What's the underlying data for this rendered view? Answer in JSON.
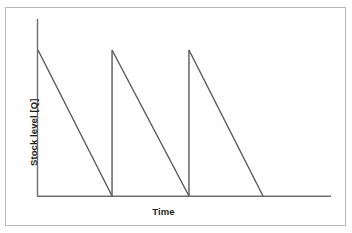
{
  "figure": {
    "background_color": "#ffffff",
    "border_color": "#b9b9b9",
    "line_color": "#58595b",
    "axis_color": "#6d6e71"
  },
  "axes": {
    "y_title": "Stock level [Q]",
    "x_title": "Time"
  },
  "chart_data": {
    "type": "line",
    "title": "",
    "subtitle": "",
    "xlabel": "Time",
    "ylabel": "Stock level [Q]",
    "xlim": [
      0,
      10
    ],
    "ylim": [
      0,
      1.18
    ],
    "grid": false,
    "legend": "none",
    "annotations": [],
    "x_tick_labels": [],
    "y_tick_labels": [],
    "series": [
      {
        "name": "Stock level",
        "x": [
          0.0,
          2.6,
          2.6,
          5.3,
          5.3,
          7.9
        ],
        "y": [
          1.0,
          0.0,
          1.0,
          0.0,
          1.0,
          0.0
        ]
      }
    ],
    "cycles": [
      {
        "index": 1,
        "start_x": 0.0,
        "end_x": 2.6,
        "peak_y": 1.0,
        "trough_y": 0.0
      },
      {
        "index": 2,
        "start_x": 2.6,
        "end_x": 5.3,
        "peak_y": 1.0,
        "trough_y": 0.0
      },
      {
        "index": 3,
        "start_x": 5.3,
        "end_x": 7.9,
        "peak_y": 1.0,
        "trough_y": 0.0
      }
    ]
  }
}
